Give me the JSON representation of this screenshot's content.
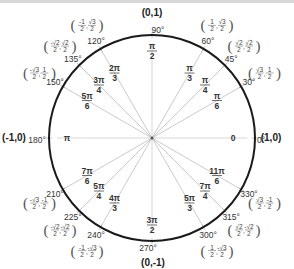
{
  "diagram": {
    "center": [
      152,
      138
    ],
    "radius": 103,
    "colors": {
      "circle": "#1a1a1a",
      "spoke": "#bdbdbd",
      "text": "#333333"
    },
    "axis_points": [
      {
        "id": "right",
        "label": "(1,0)",
        "x": 271,
        "y": 141
      },
      {
        "id": "top",
        "label": "(0,1)",
        "x": 152,
        "y": 16
      },
      {
        "id": "left",
        "label": "(-1,0)",
        "x": 14,
        "y": 141
      },
      {
        "id": "bottom",
        "label": "(0,-1)",
        "x": 153,
        "y": 266
      }
    ],
    "angles": [
      {
        "deg": 0,
        "deg_label": "0°",
        "rad_num": "0",
        "rad_den": "",
        "coord": ""
      },
      {
        "deg": 30,
        "deg_label": "30°",
        "rad_num": "π",
        "rad_den": "6",
        "coord_x": "√3/2",
        "coord_y": "1/2"
      },
      {
        "deg": 45,
        "deg_label": "45°",
        "rad_num": "π",
        "rad_den": "4",
        "coord_x": "√2/2",
        "coord_y": "√2/2"
      },
      {
        "deg": 60,
        "deg_label": "60°",
        "rad_num": "π",
        "rad_den": "3",
        "coord_x": "1/2",
        "coord_y": "√3/2"
      },
      {
        "deg": 90,
        "deg_label": "90°",
        "rad_num": "π",
        "rad_den": "2",
        "coord": ""
      },
      {
        "deg": 120,
        "deg_label": "120°",
        "rad_num": "2π",
        "rad_den": "3",
        "coord_x": "-1/2",
        "coord_y": "√3/2"
      },
      {
        "deg": 135,
        "deg_label": "135°",
        "rad_num": "3π",
        "rad_den": "4",
        "coord_x": "-√2/2",
        "coord_y": "√2/2"
      },
      {
        "deg": 150,
        "deg_label": "150°",
        "rad_num": "5π",
        "rad_den": "6",
        "coord_x": "-√3/2",
        "coord_y": "1/2"
      },
      {
        "deg": 180,
        "deg_label": "180°",
        "rad_num": "π",
        "rad_den": "",
        "coord": ""
      },
      {
        "deg": 210,
        "deg_label": "210°",
        "rad_num": "7π",
        "rad_den": "6",
        "coord_x": "-√3/2",
        "coord_y": "-1/2"
      },
      {
        "deg": 225,
        "deg_label": "225°",
        "rad_num": "5π",
        "rad_den": "4",
        "coord_x": "-√2/2",
        "coord_y": "-√2/2"
      },
      {
        "deg": 240,
        "deg_label": "240°",
        "rad_num": "4π",
        "rad_den": "3",
        "coord_x": "-1/2",
        "coord_y": "-√3/2"
      },
      {
        "deg": 270,
        "deg_label": "270°",
        "rad_num": "3π",
        "rad_den": "2",
        "coord": ""
      },
      {
        "deg": 300,
        "deg_label": "300°",
        "rad_num": "5π",
        "rad_den": "3",
        "coord_x": "1/2",
        "coord_y": "-√3/2"
      },
      {
        "deg": 315,
        "deg_label": "315°",
        "rad_num": "7π",
        "rad_den": "4",
        "coord_x": "√2/2",
        "coord_y": "-√2/2"
      },
      {
        "deg": 330,
        "deg_label": "330°",
        "rad_num": "11π",
        "rad_den": "6",
        "coord_x": "√3/2",
        "coord_y": "-1/2"
      }
    ]
  }
}
